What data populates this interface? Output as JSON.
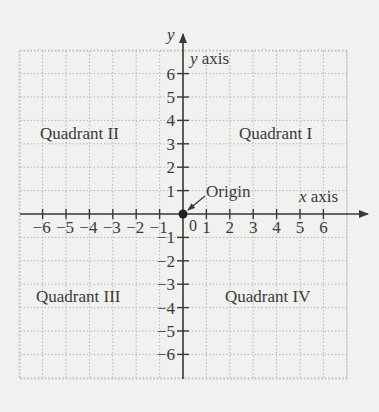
{
  "diagram": {
    "axes": {
      "x_axis_label": "x axis",
      "y_axis_label": "y axis",
      "x_var": "x",
      "y_var": "y",
      "x_ticks": [
        "-6",
        "-5",
        "-4",
        "-3",
        "-2",
        "-1",
        "1",
        "2",
        "3",
        "4",
        "5",
        "6"
      ],
      "y_ticks": [
        "6",
        "5",
        "4",
        "3",
        "2",
        "1",
        "-1",
        "-2",
        "-3",
        "-4",
        "-5",
        "-6"
      ],
      "zero_label": "0"
    },
    "origin_label": "Origin",
    "quadrants": {
      "q1": "Quadrant I",
      "q2": "Quadrant II",
      "q3": "Quadrant III",
      "q4": "Quadrant IV"
    },
    "colors": {
      "background": "#f1f1ef",
      "grid": "#b5b5b5",
      "axis": "#3a3a3a",
      "text": "#3a3a3a"
    }
  }
}
